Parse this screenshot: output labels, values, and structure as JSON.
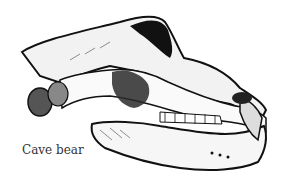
{
  "illustration": {
    "subject": "cave-bear-skull-drawing"
  },
  "caption": {
    "text": "Cave bear"
  }
}
